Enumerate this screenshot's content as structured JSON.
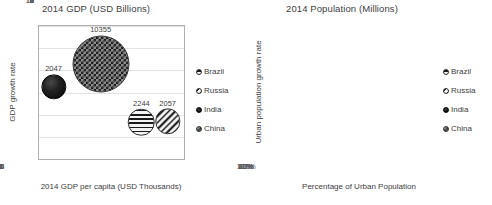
{
  "chart_data": [
    {
      "type": "scatter",
      "title": "2014 GDP (USD Billions)",
      "xlabel": "2014 GDP per capita (USD Thousands)",
      "ylabel": "GDP growth rate",
      "xlim": [
        0,
        16
      ],
      "ylim": [
        0,
        12
      ],
      "xticks": [
        "0",
        "2",
        "4",
        "6",
        "8",
        "10",
        "12",
        "14",
        "16"
      ],
      "yticks": [
        "0",
        "2",
        "4",
        "6",
        "8",
        "10",
        "12"
      ],
      "grid": true,
      "legend_position": "right",
      "bubble_value_unit": "USD Billions",
      "points": [
        {
          "name": "India",
          "x": 1.6,
          "y": 6.5,
          "value": "2047",
          "size": 2047,
          "marker": "solid"
        },
        {
          "name": "China",
          "x": 6.8,
          "y": 8.6,
          "value": "10355",
          "size": 10355,
          "marker": "checker"
        },
        {
          "name": "Brazil",
          "x": 11.3,
          "y": 3.3,
          "value": "2244",
          "size": 2244,
          "marker": "hstripe"
        },
        {
          "name": "Russia",
          "x": 14.2,
          "y": 3.4,
          "value": "2057",
          "size": 2057,
          "marker": "dstripe"
        }
      ]
    },
    {
      "type": "scatter",
      "title": "2014 Population (Millions)",
      "xlabel": "Percentage of Urban Population",
      "ylabel": "Urban population growth rate",
      "xlim": [
        0,
        100
      ],
      "ylim": [
        0,
        4.0
      ],
      "xticks": [
        "0%",
        "20%",
        "40%",
        "60%",
        "80%",
        "100%"
      ],
      "yticks": [
        "0.0",
        "0.5",
        "1.0",
        "1.5",
        "2.0",
        "2.5",
        "3.0",
        "3.5",
        "4.0"
      ],
      "grid": true,
      "legend_position": "right",
      "bubble_value_unit": "Millions",
      "points": [
        {
          "name": "India",
          "x": 32,
          "y": 2.35,
          "value": "1277",
          "size": 1277,
          "marker": "solid"
        },
        {
          "name": "China",
          "x": 54,
          "y": 3.05,
          "value": "1370",
          "size": 1370,
          "marker": "checker"
        },
        {
          "name": "Brazil",
          "x": 86,
          "y": 1.18,
          "value": "203",
          "size": 203,
          "marker": "hstripe"
        },
        {
          "name": "Russia",
          "x": 74,
          "y": 0.27,
          "value": "143",
          "size": 143,
          "marker": "dstripe"
        }
      ]
    }
  ],
  "legend": {
    "items": [
      {
        "label": "Brazil",
        "marker": "hstripe"
      },
      {
        "label": "Russia",
        "marker": "dstripe"
      },
      {
        "label": "India",
        "marker": "solid"
      },
      {
        "label": "China",
        "marker": "checker"
      }
    ]
  },
  "colors": {
    "background": "#ffffff",
    "frame": "#b0b0b0",
    "gridline": "#e2e2e2",
    "text": "#3f3f3f",
    "marker_dark": "#111111",
    "marker_light": "#f2f2f2"
  }
}
